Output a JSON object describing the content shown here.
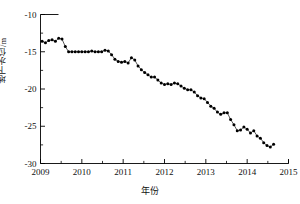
{
  "chart_data": {
    "type": "scatter",
    "title": "",
    "subtitle": "",
    "xlabel": "年份",
    "ylabel": "地下水位/m",
    "xlim": [
      2009,
      2015
    ],
    "ylim": [
      -30,
      -10
    ],
    "grid": false,
    "legend": null,
    "annotations": [],
    "xticks": [
      2009,
      2010,
      2011,
      2012,
      2013,
      2014,
      2015
    ],
    "xticklabels": [
      "2009",
      "2010",
      "2011",
      "2012",
      "2013",
      "2014",
      "2015"
    ],
    "yticks": [
      -30,
      -25,
      -20,
      -15,
      -10
    ],
    "yticklabels": [
      "-30",
      "-25",
      "-20",
      "-15",
      "-10"
    ],
    "xminor_per_interval": 1,
    "marker": "filled-circle",
    "marker_color": "#000000",
    "line_color": "#000000",
    "series": [
      {
        "name": "地下水位",
        "x": [
          2009.04,
          2009.12,
          2009.2,
          2009.28,
          2009.36,
          2009.44,
          2009.52,
          2009.6,
          2009.68,
          2009.76,
          2009.84,
          2009.92,
          2010.0,
          2010.08,
          2010.16,
          2010.24,
          2010.32,
          2010.4,
          2010.48,
          2010.56,
          2010.64,
          2010.72,
          2010.8,
          2010.88,
          2010.96,
          2011.04,
          2011.12,
          2011.2,
          2011.28,
          2011.36,
          2011.44,
          2011.52,
          2011.6,
          2011.68,
          2011.76,
          2011.84,
          2011.92,
          2012.0,
          2012.08,
          2012.16,
          2012.24,
          2012.32,
          2012.4,
          2012.48,
          2012.56,
          2012.64,
          2012.72,
          2012.8,
          2012.88,
          2012.96,
          2013.04,
          2013.12,
          2013.2,
          2013.28,
          2013.36,
          2013.44,
          2013.52,
          2013.6,
          2013.68,
          2013.76,
          2013.84,
          2013.92,
          2014.0,
          2014.08,
          2014.16,
          2014.24,
          2014.32,
          2014.4,
          2014.48,
          2014.56,
          2014.64
        ],
        "values": [
          -13.6,
          -13.8,
          -13.5,
          -13.4,
          -13.6,
          -13.2,
          -13.3,
          -14.3,
          -15.0,
          -15.0,
          -15.0,
          -15.0,
          -15.0,
          -15.0,
          -15.0,
          -14.9,
          -15.0,
          -15.0,
          -15.0,
          -14.8,
          -14.9,
          -15.4,
          -16.0,
          -16.3,
          -16.4,
          -16.3,
          -16.5,
          -15.8,
          -16.1,
          -16.9,
          -17.4,
          -17.8,
          -18.1,
          -18.4,
          -18.4,
          -18.8,
          -19.2,
          -19.4,
          -19.3,
          -19.4,
          -19.2,
          -19.3,
          -19.6,
          -19.9,
          -20.1,
          -20.1,
          -20.4,
          -20.9,
          -21.2,
          -21.3,
          -21.8,
          -22.3,
          -22.6,
          -23.1,
          -23.4,
          -23.2,
          -23.2,
          -24.1,
          -24.8,
          -25.6,
          -25.5,
          -25.1,
          -25.4,
          -25.9,
          -25.6,
          -26.3,
          -26.6,
          -27.2,
          -27.6,
          -27.8,
          -27.4
        ]
      }
    ]
  }
}
